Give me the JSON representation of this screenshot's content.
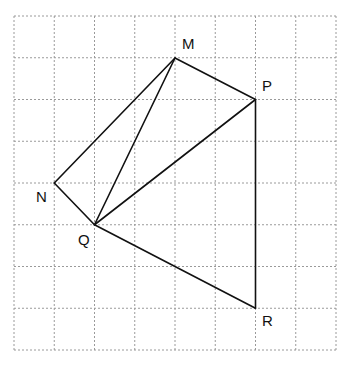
{
  "figure": {
    "background_color": "#ffffff",
    "canvas": {
      "width": 352,
      "height": 372
    },
    "grid": {
      "name": "dotted-square-grid",
      "x_start": 14,
      "y_start": 16,
      "cell_width": 40.25,
      "cell_height": 41.75,
      "columns": 8,
      "rows": 8,
      "line_color": "#9a9a9a",
      "line_width": 1,
      "dash_pattern": "2,2",
      "x_lines": [
        14,
        54.25,
        94.5,
        134.75,
        175,
        215.25,
        255.5,
        295.75,
        336
      ],
      "y_lines": [
        16,
        57.75,
        99.5,
        141.25,
        183,
        224.75,
        266.5,
        308.25,
        350
      ]
    },
    "stroke_color": "#111111",
    "stroke_width": 1.6,
    "points": [
      {
        "id": "M",
        "label": "M",
        "x": 175,
        "y": 58,
        "label_x": 182,
        "label_y": 49,
        "col": 4,
        "row": 1
      },
      {
        "id": "P",
        "label": "P",
        "x": 255.5,
        "y": 99.5,
        "label_x": 262,
        "label_y": 91,
        "col": 6,
        "row": 2
      },
      {
        "id": "N",
        "label": "N",
        "x": 54.25,
        "y": 183,
        "label_x": 36,
        "label_y": 202,
        "col": 1,
        "row": 4
      },
      {
        "id": "Q",
        "label": "Q",
        "x": 94.5,
        "y": 224.75,
        "label_x": 78,
        "label_y": 245,
        "col": 2,
        "row": 5
      },
      {
        "id": "R",
        "label": "R",
        "x": 255.5,
        "y": 308.25,
        "label_x": 262,
        "label_y": 326,
        "col": 6,
        "row": 7
      }
    ],
    "segments": [
      {
        "name": "segment-M-N",
        "from": "M",
        "to": "N"
      },
      {
        "name": "segment-M-Q",
        "from": "M",
        "to": "Q"
      },
      {
        "name": "segment-M-P",
        "from": "M",
        "to": "P"
      },
      {
        "name": "segment-N-Q",
        "from": "N",
        "to": "Q"
      },
      {
        "name": "segment-Q-P",
        "from": "Q",
        "to": "P"
      },
      {
        "name": "segment-Q-R",
        "from": "Q",
        "to": "R"
      },
      {
        "name": "segment-P-R",
        "from": "P",
        "to": "R"
      }
    ]
  }
}
